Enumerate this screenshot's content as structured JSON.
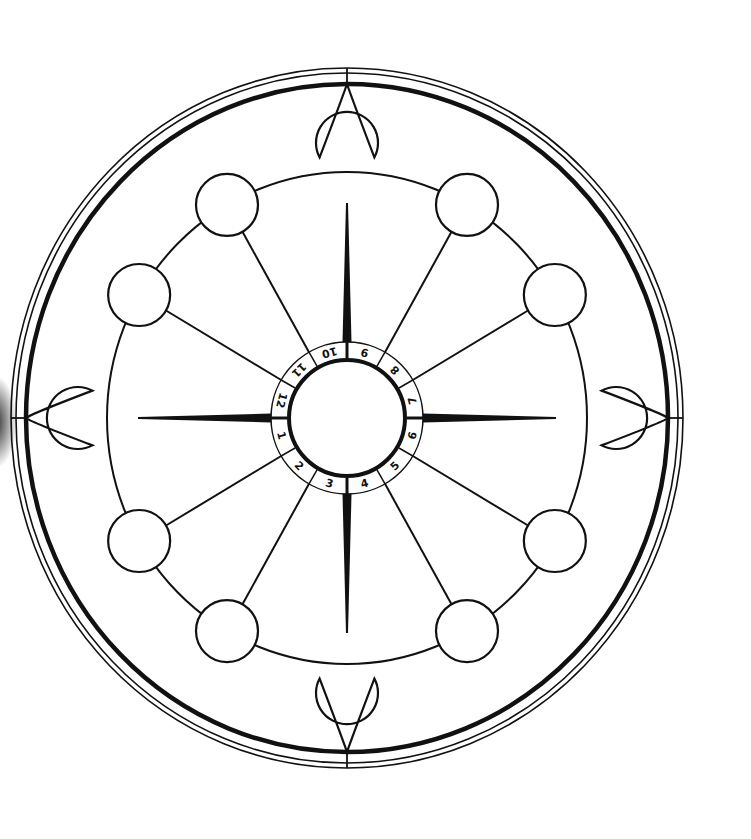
{
  "diagram": {
    "type": "house-wheel",
    "center": {
      "x": 347,
      "y": 418
    },
    "stroke_color": "#111111",
    "background_color": "#ffffff",
    "outer_rings": [
      {
        "rx": 336,
        "ry": 350,
        "stroke_width": 1.6
      },
      {
        "rx": 331,
        "ry": 345,
        "stroke_width": 1.6
      },
      {
        "rx": 321,
        "ry": 334,
        "stroke_width": 4.5
      }
    ],
    "node_ring": {
      "rx": 240,
      "ry": 246,
      "stroke_width": 2
    },
    "inner_ring": {
      "outer_r": 76,
      "inner_r": 58
    },
    "house_labels": [
      "1",
      "2",
      "3",
      "4",
      "5",
      "6",
      "7",
      "8",
      "9",
      "10",
      "11",
      "12"
    ],
    "nodes": [
      {
        "angle": 30,
        "type": "circle"
      },
      {
        "angle": 60,
        "type": "circle"
      },
      {
        "angle": 90,
        "type": "teardrop"
      },
      {
        "angle": 120,
        "type": "circle"
      },
      {
        "angle": 150,
        "type": "circle"
      },
      {
        "angle": 180,
        "type": "teardrop"
      },
      {
        "angle": 210,
        "type": "circle"
      },
      {
        "angle": 240,
        "type": "circle"
      },
      {
        "angle": 270,
        "type": "teardrop"
      },
      {
        "angle": 300,
        "type": "circle"
      },
      {
        "angle": 330,
        "type": "circle"
      },
      {
        "angle": 0,
        "type": "teardrop"
      }
    ],
    "node_radius": 31
  }
}
